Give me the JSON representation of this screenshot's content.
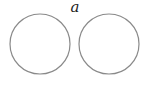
{
  "diagram": {
    "label": "a",
    "shapes": [
      {
        "type": "circle",
        "name": "left-circle"
      },
      {
        "type": "circle",
        "name": "right-circle"
      }
    ],
    "stroke_color": "#8a8a8a"
  }
}
